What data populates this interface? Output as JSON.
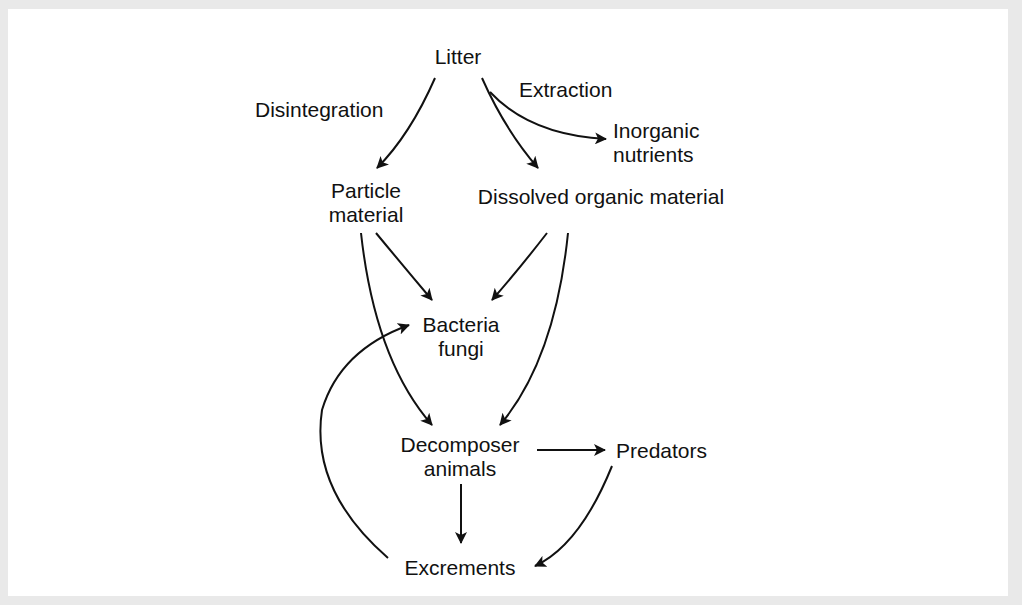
{
  "diagram": {
    "type": "flow",
    "nodes": {
      "litter": {
        "lines": [
          "Litter"
        ]
      },
      "particle_material": {
        "lines": [
          "Particle",
          "material"
        ]
      },
      "dissolved_organic_material": {
        "lines": [
          "Dissolved organic material"
        ]
      },
      "inorganic_nutrients": {
        "lines": [
          "Inorganic",
          "nutrients"
        ]
      },
      "bacteria_fungi": {
        "lines": [
          "Bacteria",
          "fungi"
        ]
      },
      "decomposer_animals": {
        "lines": [
          "Decomposer",
          "animals"
        ]
      },
      "predators": {
        "lines": [
          "Predators"
        ]
      },
      "excrements": {
        "lines": [
          "Excrements"
        ]
      }
    },
    "edge_labels": {
      "disintegration": "Disintegration",
      "extraction": "Extraction"
    },
    "edges": [
      {
        "from": "Litter",
        "to": "Particle material",
        "label": "Disintegration"
      },
      {
        "from": "Litter",
        "to": "Dissolved organic material",
        "label": "Extraction"
      },
      {
        "from": "Litter",
        "to": "Inorganic nutrients",
        "label": "Extraction"
      },
      {
        "from": "Particle material",
        "to": "Bacteria fungi"
      },
      {
        "from": "Particle material",
        "to": "Decomposer animals"
      },
      {
        "from": "Dissolved organic material",
        "to": "Bacteria fungi"
      },
      {
        "from": "Dissolved organic material",
        "to": "Decomposer animals"
      },
      {
        "from": "Decomposer animals",
        "to": "Predators"
      },
      {
        "from": "Decomposer animals",
        "to": "Excrements"
      },
      {
        "from": "Predators",
        "to": "Excrements"
      },
      {
        "from": "Excrements",
        "to": "Bacteria fungi"
      }
    ],
    "colors": {
      "background": "#ffffff",
      "border": "#e9e9e9",
      "ink": "#111111"
    }
  }
}
